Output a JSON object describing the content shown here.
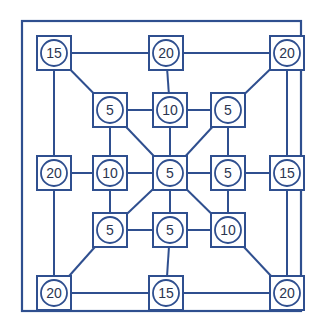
{
  "diagram": {
    "colors": {
      "stroke": "#2f4f8f",
      "text": "#2a3550",
      "background": "#ffffff"
    },
    "frame": {
      "x": 22,
      "y": 21,
      "w": 279,
      "h": 290
    },
    "node_size": 34,
    "circle_radius": 13,
    "nodes": [
      {
        "id": "o-tl",
        "label": "15",
        "x": 54,
        "y": 53
      },
      {
        "id": "o-tc",
        "label": "20",
        "x": 166,
        "y": 53
      },
      {
        "id": "o-tr",
        "label": "20",
        "x": 287,
        "y": 53
      },
      {
        "id": "o-ml",
        "label": "20",
        "x": 54,
        "y": 173
      },
      {
        "id": "o-mr",
        "label": "15",
        "x": 287,
        "y": 173
      },
      {
        "id": "o-bl",
        "label": "20",
        "x": 54,
        "y": 293
      },
      {
        "id": "o-bc",
        "label": "15",
        "x": 166,
        "y": 293
      },
      {
        "id": "o-br",
        "label": "20",
        "x": 287,
        "y": 293
      },
      {
        "id": "i-tl",
        "label": "5",
        "x": 110,
        "y": 110
      },
      {
        "id": "i-tc",
        "label": "10",
        "x": 170,
        "y": 110
      },
      {
        "id": "i-tr",
        "label": "5",
        "x": 228,
        "y": 110
      },
      {
        "id": "i-ml",
        "label": "10",
        "x": 110,
        "y": 173
      },
      {
        "id": "i-c",
        "label": "5",
        "x": 170,
        "y": 173
      },
      {
        "id": "i-mr",
        "label": "5",
        "x": 228,
        "y": 173
      },
      {
        "id": "i-bl",
        "label": "5",
        "x": 110,
        "y": 230
      },
      {
        "id": "i-bc",
        "label": "5",
        "x": 170,
        "y": 230
      },
      {
        "id": "i-br",
        "label": "10",
        "x": 228,
        "y": 230
      }
    ],
    "edges": [
      [
        "o-tl",
        "o-tc"
      ],
      [
        "o-tc",
        "o-tr"
      ],
      [
        "o-bl",
        "o-bc"
      ],
      [
        "o-bc",
        "o-br"
      ],
      [
        "o-tl",
        "o-ml"
      ],
      [
        "o-ml",
        "o-bl"
      ],
      [
        "o-tr",
        "o-mr"
      ],
      [
        "o-mr",
        "o-br"
      ],
      [
        "o-tl",
        "i-tl"
      ],
      [
        "o-tr",
        "i-tr"
      ],
      [
        "o-bl",
        "i-bl"
      ],
      [
        "o-br",
        "i-br"
      ],
      [
        "o-tc",
        "i-tc"
      ],
      [
        "o-ml",
        "i-ml"
      ],
      [
        "o-mr",
        "i-mr"
      ],
      [
        "o-bc",
        "i-bc"
      ],
      [
        "i-tl",
        "i-tc"
      ],
      [
        "i-tc",
        "i-tr"
      ],
      [
        "i-ml",
        "i-c"
      ],
      [
        "i-c",
        "i-mr"
      ],
      [
        "i-bl",
        "i-bc"
      ],
      [
        "i-bc",
        "i-br"
      ],
      [
        "i-tl",
        "i-ml"
      ],
      [
        "i-ml",
        "i-bl"
      ],
      [
        "i-tc",
        "i-c"
      ],
      [
        "i-c",
        "i-bc"
      ],
      [
        "i-tr",
        "i-mr"
      ],
      [
        "i-mr",
        "i-br"
      ],
      [
        "i-tl",
        "i-c"
      ],
      [
        "i-tr",
        "i-c"
      ],
      [
        "i-bl",
        "i-c"
      ],
      [
        "i-br",
        "i-c"
      ]
    ]
  }
}
